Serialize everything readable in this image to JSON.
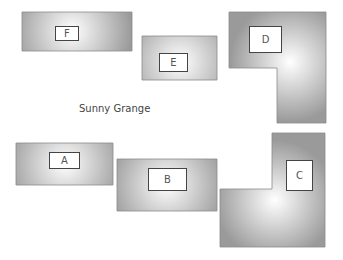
{
  "title": "Sunny Grange",
  "colors": {
    "shape_edge": "#9a9a9a",
    "shape_center": "#ffffff",
    "label_border": "#444444"
  },
  "blocks": [
    {
      "id": "F",
      "label": "F",
      "shape": "rect",
      "points": "22,12 132,12 132,51 22,51",
      "center": [
        72,
        31
      ],
      "label_box": [
        55,
        26,
        24,
        15
      ]
    },
    {
      "id": "E",
      "label": "E",
      "shape": "rect",
      "points": "142,36 217,36 217,80 142,80",
      "center": [
        180,
        62
      ],
      "label_box": [
        159,
        53,
        29,
        19
      ]
    },
    {
      "id": "D",
      "label": "D",
      "shape": "L",
      "points": "229,12 326,12 326,123 277,123 277,68 229,68",
      "center": [
        290,
        62
      ],
      "label_box": [
        249,
        26,
        33,
        27
      ]
    },
    {
      "id": "A",
      "label": "A",
      "shape": "rect",
      "points": "16,143 113,143 113,185 16,185",
      "center": [
        65,
        164
      ],
      "label_box": [
        49,
        152,
        31,
        17
      ]
    },
    {
      "id": "B",
      "label": "B",
      "shape": "rect",
      "points": "117,159 217,159 217,211 117,211",
      "center": [
        167,
        185
      ],
      "label_box": [
        148,
        168,
        39,
        23
      ]
    },
    {
      "id": "C",
      "label": "C",
      "shape": "L",
      "points": "272,133 325,133 325,247 220,247 220,189 272,189",
      "center": [
        275,
        200
      ],
      "label_box": [
        286,
        160,
        27,
        31
      ]
    }
  ]
}
